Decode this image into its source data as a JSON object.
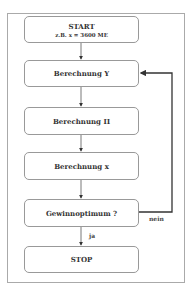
{
  "flowchart": {
    "start": {
      "title": "START",
      "subtitle": "z.B. x = 3600 ME"
    },
    "steps": [
      "Berechnung Y",
      "Berechnung Π",
      "Berechnung x"
    ],
    "decision": "Gewinnoptimum ?",
    "stop": "STOP",
    "edges": {
      "yes_label": "ja",
      "no_label": "nein"
    }
  }
}
